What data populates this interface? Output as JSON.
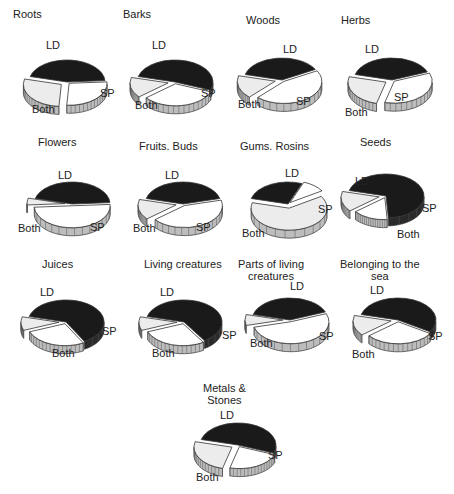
{
  "chart_data": {
    "type": "pie",
    "style": "3d exploded pie",
    "legend": {
      "LD": "black slice",
      "SP": "white slice",
      "Both": "light gray slice"
    },
    "colors": {
      "LD": "#1a1a1a",
      "SP": "#ffffff",
      "Both": "#ececec",
      "edge": "#333333"
    },
    "charts": [
      {
        "title": "Roots",
        "labels": [
          "LD",
          "SP",
          "Both"
        ],
        "values": [
          45,
          27,
          28
        ]
      },
      {
        "title": "Barks",
        "labels": [
          "LD",
          "SP",
          "Both"
        ],
        "values": [
          52,
          33,
          15
        ]
      },
      {
        "title": "Woods",
        "labels": [
          "LD",
          "SP",
          "Both"
        ],
        "values": [
          38,
          45,
          17
        ]
      },
      {
        "title": "Herbs",
        "labels": [
          "LD",
          "SP",
          "Both"
        ],
        "values": [
          40,
          35,
          25
        ]
      },
      {
        "title": "Flowers",
        "labels": [
          "LD",
          "SP",
          "Both"
        ],
        "values": [
          45,
          50,
          5
        ]
      },
      {
        "title": "Fruits. Buds",
        "labels": [
          "LD",
          "SP",
          "Both"
        ],
        "values": [
          42,
          43,
          15
        ]
      },
      {
        "title": "Gums. Rosins",
        "labels": [
          "LD",
          "SP",
          "Both"
        ],
        "values": [
          27,
          10,
          63
        ]
      },
      {
        "title": "Seeds",
        "labels": [
          "LD",
          "SP",
          "Both"
        ],
        "values": [
          70,
          15,
          15
        ]
      },
      {
        "title": "Juices",
        "labels": [
          "LD",
          "SP",
          "Both"
        ],
        "values": [
          63,
          27,
          10
        ]
      },
      {
        "title": "Living creatures",
        "labels": [
          "LD",
          "SP",
          "Both"
        ],
        "values": [
          62,
          28,
          10
        ]
      },
      {
        "title": "Parts of living\ncreatures",
        "labels": [
          "LD",
          "SP",
          "Both"
        ],
        "values": [
          40,
          52,
          8
        ]
      },
      {
        "title": "Belonging to the\nsea",
        "labels": [
          "LD",
          "SP",
          "Both"
        ],
        "values": [
          55,
          30,
          15
        ]
      },
      {
        "title": "Metals &\nStones",
        "labels": [
          "LD",
          "SP",
          "Both"
        ],
        "values": [
          52,
          23,
          25
        ]
      }
    ]
  },
  "panels": [
    {
      "title": "Roots",
      "x": 8,
      "y": 8,
      "tx": 5,
      "ty": 0,
      "cx": 67,
      "cy": 82,
      "labels": {
        "LD": [
          46,
          40
        ],
        "SP": [
          100,
          88
        ],
        "Both": [
          32,
          104
        ]
      }
    },
    {
      "title": "Barks",
      "x": 118,
      "y": 8,
      "tx": 5,
      "ty": 0,
      "cx": 175,
      "cy": 82,
      "labels": {
        "LD": [
          152,
          40
        ],
        "SP": [
          201,
          88
        ],
        "Both": [
          135,
          100
        ]
      }
    },
    {
      "title": "Woods",
      "x": 228,
      "y": 8,
      "tx": 18,
      "ty": 6,
      "cx": 282,
      "cy": 80,
      "labels": {
        "LD": [
          283,
          44
        ],
        "SP": [
          296,
          96
        ],
        "Both": [
          238,
          99
        ]
      }
    },
    {
      "title": "Herbs",
      "x": 338,
      "y": 8,
      "tx": 3,
      "ty": 6,
      "cx": 392,
      "cy": 80,
      "labels": {
        "LD": [
          365,
          44
        ],
        "SP": [
          394,
          92
        ],
        "Both": [
          345,
          107
        ]
      }
    },
    {
      "title": "Flowers",
      "x": 8,
      "y": 133,
      "tx": 30,
      "ty": 3,
      "cx": 72,
      "cy": 204,
      "labels": {
        "LD": [
          58,
          170
        ],
        "SP": [
          90,
          222
        ],
        "Both": [
          18,
          223
        ]
      }
    },
    {
      "title": "Fruits. Buds",
      "x": 118,
      "y": 133,
      "tx": 21,
      "ty": 7,
      "cx": 183,
      "cy": 204,
      "labels": {
        "LD": [
          165,
          170
        ],
        "SP": [
          196,
          222
        ],
        "Both": [
          133,
          223
        ]
      }
    },
    {
      "title": "Gums. Rosins",
      "x": 228,
      "y": 133,
      "tx": 12,
      "ty": 7,
      "cx": 288,
      "cy": 204,
      "labels": {
        "LD": [
          285,
          168
        ],
        "SP": [
          318,
          204
        ],
        "Both": [
          242,
          228
        ]
      }
    },
    {
      "title": "Seeds",
      "x": 338,
      "y": 133,
      "tx": 22,
      "ty": 3,
      "cx": 386,
      "cy": 196,
      "labels": {
        "LD": [
          355,
          176
        ],
        "SP": [
          422,
          203
        ],
        "Both": [
          397,
          229
        ]
      }
    },
    {
      "title": "Juices",
      "x": 8,
      "y": 255,
      "tx": 34,
      "ty": 3,
      "cx": 66,
      "cy": 322,
      "labels": {
        "LD": [
          40,
          287
        ],
        "SP": [
          102,
          326
        ],
        "Both": [
          52,
          348
        ]
      }
    },
    {
      "title": "Living creatures",
      "x": 118,
      "y": 255,
      "tx": 26,
      "ty": 3,
      "cx": 184,
      "cy": 322,
      "labels": {
        "LD": [
          160,
          287
        ],
        "SP": [
          222,
          330
        ],
        "Both": [
          152,
          348
        ]
      }
    },
    {
      "title": "Parts of living\ncreatures",
      "x": 228,
      "y": 255,
      "tx": 10,
      "ty": 3,
      "cx": 290,
      "cy": 320,
      "labels": {
        "LD": [
          290,
          281
        ],
        "SP": [
          319,
          331
        ],
        "Both": [
          250,
          338
        ]
      }
    },
    {
      "title": "Belonging to the\nsea",
      "x": 338,
      "y": 255,
      "tx": 2,
      "ty": 3,
      "cx": 398,
      "cy": 320,
      "labels": {
        "LD": [
          370,
          285
        ],
        "SP": [
          428,
          331
        ],
        "Both": [
          352,
          349
        ]
      }
    },
    {
      "title": "Metals &\nStones",
      "x": 173,
      "y": 375,
      "tx": 30,
      "ty": 7,
      "cx": 238,
      "cy": 445,
      "labels": {
        "LD": [
          220,
          410
        ],
        "SP": [
          268,
          450
        ],
        "Both": [
          196,
          472
        ]
      }
    }
  ]
}
